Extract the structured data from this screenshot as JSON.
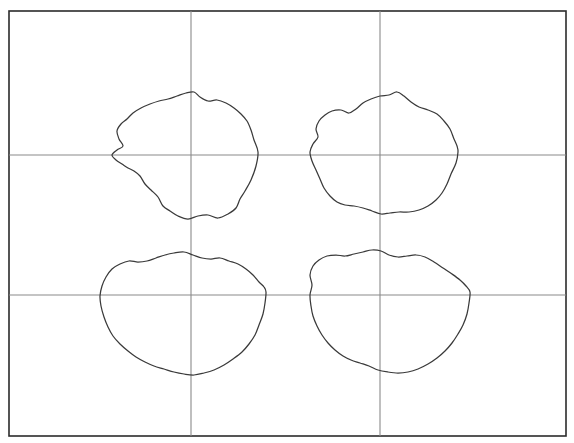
{
  "figure": {
    "background_color": "#ffffff",
    "frame_color": "#2b2b2b",
    "grid_color": "#8a8a8a",
    "contour_color": "#3a3a3a",
    "canvas": {
      "width": 574,
      "height": 443
    }
  },
  "chart_data": {
    "type": "line",
    "xlabel": "",
    "ylabel": "",
    "xlim": [
      9,
      566
    ],
    "ylim": [
      11,
      436
    ],
    "grid": true,
    "legend": "none",
    "tick_labels_x": [],
    "tick_labels_y": [],
    "frame": {
      "x0": 9,
      "y0": 11,
      "x1": 566,
      "y1": 436
    },
    "gridlines": {
      "vertical_x": [
        191,
        380
      ],
      "horizontal_y": [
        155,
        295
      ]
    },
    "series": [
      {
        "name": "contour-top-left",
        "closed": true,
        "center": [
          191,
          155
        ],
        "bbox": [
          110,
          92,
          258,
          219
        ],
        "mean_radius": 69,
        "points": [
          [
            258,
            152
          ],
          [
            256,
            166
          ],
          [
            251,
            180
          ],
          [
            245,
            191
          ],
          [
            240,
            199
          ],
          [
            236,
            208
          ],
          [
            228,
            214
          ],
          [
            218,
            218
          ],
          [
            208,
            215
          ],
          [
            198,
            216
          ],
          [
            188,
            219
          ],
          [
            178,
            216
          ],
          [
            170,
            211
          ],
          [
            163,
            206
          ],
          [
            158,
            197
          ],
          [
            151,
            190
          ],
          [
            145,
            184
          ],
          [
            140,
            176
          ],
          [
            134,
            171
          ],
          [
            128,
            168
          ],
          [
            122,
            164
          ],
          [
            116,
            160
          ],
          [
            112,
            155
          ],
          [
            117,
            150
          ],
          [
            123,
            146
          ],
          [
            119,
            139
          ],
          [
            117,
            131
          ],
          [
            121,
            124
          ],
          [
            127,
            119
          ],
          [
            133,
            113
          ],
          [
            141,
            108
          ],
          [
            150,
            104
          ],
          [
            159,
            101
          ],
          [
            168,
            99
          ],
          [
            177,
            96
          ],
          [
            186,
            93
          ],
          [
            194,
            92
          ],
          [
            200,
            97
          ],
          [
            208,
            101
          ],
          [
            217,
            100
          ],
          [
            226,
            103
          ],
          [
            234,
            108
          ],
          [
            241,
            114
          ],
          [
            247,
            121
          ],
          [
            251,
            130
          ],
          [
            254,
            140
          ],
          [
            258,
            152
          ]
        ]
      },
      {
        "name": "contour-top-right",
        "closed": true,
        "center": [
          380,
          155
        ],
        "bbox": [
          310,
          92,
          458,
          214
        ],
        "mean_radius": 68,
        "points": [
          [
            458,
            152
          ],
          [
            456,
            163
          ],
          [
            451,
            174
          ],
          [
            447,
            184
          ],
          [
            442,
            193
          ],
          [
            436,
            200
          ],
          [
            428,
            206
          ],
          [
            419,
            210
          ],
          [
            409,
            212
          ],
          [
            399,
            212
          ],
          [
            390,
            213
          ],
          [
            381,
            214
          ],
          [
            372,
            211
          ],
          [
            363,
            208
          ],
          [
            354,
            206
          ],
          [
            345,
            205
          ],
          [
            337,
            202
          ],
          [
            330,
            196
          ],
          [
            324,
            188
          ],
          [
            320,
            179
          ],
          [
            316,
            170
          ],
          [
            312,
            161
          ],
          [
            310,
            152
          ],
          [
            313,
            144
          ],
          [
            318,
            137
          ],
          [
            316,
            129
          ],
          [
            319,
            121
          ],
          [
            325,
            115
          ],
          [
            332,
            111
          ],
          [
            341,
            110
          ],
          [
            349,
            113
          ],
          [
            356,
            109
          ],
          [
            363,
            103
          ],
          [
            371,
            99
          ],
          [
            380,
            96
          ],
          [
            389,
            95
          ],
          [
            397,
            92
          ],
          [
            404,
            96
          ],
          [
            411,
            102
          ],
          [
            419,
            107
          ],
          [
            428,
            110
          ],
          [
            437,
            114
          ],
          [
            444,
            121
          ],
          [
            450,
            129
          ],
          [
            454,
            139
          ],
          [
            457,
            146
          ],
          [
            458,
            152
          ]
        ]
      },
      {
        "name": "contour-bottom-left",
        "closed": true,
        "center": [
          191,
          295
        ],
        "bbox": [
          100,
          252,
          266,
          375
        ],
        "mean_radius": 72,
        "points": [
          [
            266,
            292
          ],
          [
            265,
            303
          ],
          [
            263,
            314
          ],
          [
            259,
            325
          ],
          [
            255,
            335
          ],
          [
            249,
            344
          ],
          [
            242,
            352
          ],
          [
            233,
            359
          ],
          [
            224,
            365
          ],
          [
            214,
            370
          ],
          [
            204,
            373
          ],
          [
            194,
            375
          ],
          [
            184,
            374
          ],
          [
            174,
            372
          ],
          [
            164,
            369
          ],
          [
            154,
            366
          ],
          [
            145,
            362
          ],
          [
            136,
            357
          ],
          [
            128,
            351
          ],
          [
            120,
            344
          ],
          [
            113,
            336
          ],
          [
            108,
            327
          ],
          [
            104,
            317
          ],
          [
            101,
            306
          ],
          [
            100,
            296
          ],
          [
            102,
            286
          ],
          [
            106,
            277
          ],
          [
            112,
            269
          ],
          [
            120,
            264
          ],
          [
            129,
            261
          ],
          [
            138,
            262
          ],
          [
            147,
            261
          ],
          [
            156,
            258
          ],
          [
            165,
            255
          ],
          [
            174,
            253
          ],
          [
            184,
            252
          ],
          [
            193,
            255
          ],
          [
            202,
            258
          ],
          [
            211,
            259
          ],
          [
            220,
            258
          ],
          [
            229,
            261
          ],
          [
            238,
            264
          ],
          [
            246,
            269
          ],
          [
            253,
            275
          ],
          [
            259,
            282
          ],
          [
            264,
            287
          ],
          [
            266,
            292
          ]
        ]
      },
      {
        "name": "contour-bottom-right",
        "closed": true,
        "center": [
          380,
          295
        ],
        "bbox": [
          310,
          250,
          470,
          373
        ],
        "mean_radius": 73,
        "points": [
          [
            470,
            292
          ],
          [
            469,
            303
          ],
          [
            467,
            314
          ],
          [
            463,
            325
          ],
          [
            458,
            334
          ],
          [
            452,
            343
          ],
          [
            445,
            351
          ],
          [
            437,
            358
          ],
          [
            428,
            364
          ],
          [
            418,
            369
          ],
          [
            408,
            372
          ],
          [
            398,
            373
          ],
          [
            388,
            372
          ],
          [
            378,
            370
          ],
          [
            369,
            366
          ],
          [
            360,
            363
          ],
          [
            351,
            360
          ],
          [
            343,
            356
          ],
          [
            335,
            350
          ],
          [
            328,
            343
          ],
          [
            322,
            335
          ],
          [
            317,
            326
          ],
          [
            313,
            316
          ],
          [
            311,
            306
          ],
          [
            310,
            295
          ],
          [
            312,
            285
          ],
          [
            310,
            275
          ],
          [
            313,
            266
          ],
          [
            319,
            260
          ],
          [
            327,
            256
          ],
          [
            336,
            255
          ],
          [
            345,
            256
          ],
          [
            354,
            254
          ],
          [
            363,
            252
          ],
          [
            372,
            250
          ],
          [
            381,
            251
          ],
          [
            389,
            255
          ],
          [
            398,
            257
          ],
          [
            407,
            256
          ],
          [
            416,
            255
          ],
          [
            425,
            257
          ],
          [
            434,
            262
          ],
          [
            443,
            268
          ],
          [
            452,
            274
          ],
          [
            460,
            280
          ],
          [
            466,
            286
          ],
          [
            470,
            292
          ]
        ]
      }
    ]
  }
}
